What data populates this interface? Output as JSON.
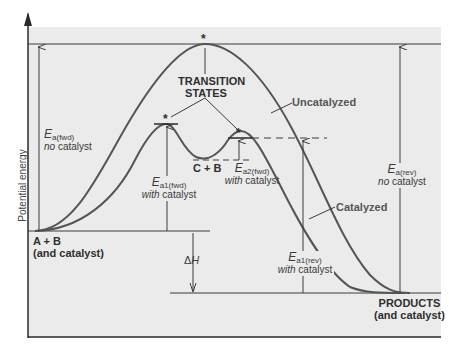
{
  "diagram": {
    "type": "reaction energy profile",
    "y_axis_label": "Potential energy",
    "curves": {
      "uncatalyzed": {
        "label": "Uncatalyzed",
        "color": "#505050"
      },
      "catalyzed": {
        "label": "Catalyzed",
        "color": "#505050"
      }
    },
    "transition_states_label_line1": "TRANSITION",
    "transition_states_label_line2": "STATES",
    "transition_marker": "*",
    "intermediate_label": "C + B",
    "reactants": {
      "line1": "A + B",
      "line2": "(and catalyst)"
    },
    "products": {
      "line1": "PRODUCTS",
      "line2": "(and catalyst)"
    },
    "delta_h": {
      "symbol": "Δ",
      "var": "H"
    },
    "energies": {
      "ea_fwd": {
        "E": "E",
        "sub": "a(fwd)",
        "note_em": "no",
        "note_rest": " catalyst"
      },
      "ea_rev": {
        "E": "E",
        "sub": "a(rev)",
        "note_em": "no",
        "note_rest": " catalyst"
      },
      "ea1_fwd": {
        "E": "E",
        "sub": "a1(fwd)",
        "note_em": "with",
        "note_rest": " catalyst"
      },
      "ea2_fwd": {
        "E": "E",
        "sub": "a2(fwd)",
        "note_em": "with",
        "note_rest": " catalyst"
      },
      "ea1_rev": {
        "E": "E",
        "sub": "a1(rev)",
        "note_em": "with",
        "note_rest": " catalyst"
      }
    },
    "colors": {
      "panel_bg": "#ebebeb",
      "line": "#3c3c3c",
      "curve": "#555555",
      "text": "#3a3a3a"
    }
  }
}
